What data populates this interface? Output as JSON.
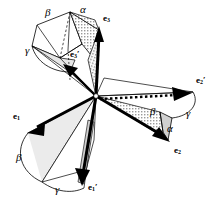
{
  "figure": {
    "type": "vector-diagram",
    "background": "#ffffff",
    "ink": "#000000",
    "fill_shade": "#b9b9b9",
    "width": 216,
    "height": 211,
    "origin": {
      "x": 96,
      "y": 96
    },
    "vectors": [
      {
        "name": "e1",
        "label": "e",
        "sub": "1",
        "prime": "",
        "label_x": 13,
        "label_y": 118,
        "tip_x": 28,
        "tip_y": 132,
        "style": "solid-bold"
      },
      {
        "name": "e2",
        "label": "e",
        "sub": "2",
        "prime": "",
        "label_x": 174,
        "label_y": 152,
        "tip_x": 170,
        "tip_y": 143,
        "style": "solid-bold"
      },
      {
        "name": "e3",
        "label": "e",
        "sub": "3",
        "prime": "",
        "label_x": 103,
        "label_y": 20,
        "tip_x": 99,
        "tip_y": 27,
        "style": "solid-bold"
      },
      {
        "name": "e1p",
        "label": "e",
        "sub": "1",
        "prime": "′",
        "label_x": 90,
        "label_y": 189,
        "tip_x": 84,
        "tip_y": 184,
        "style": "solid-bold"
      },
      {
        "name": "e2p",
        "label": "e",
        "sub": "2",
        "prime": "′",
        "label_x": 197,
        "label_y": 82,
        "tip_x": 193,
        "tip_y": 92,
        "style": "dotted-bold"
      },
      {
        "name": "e3p",
        "label": "e",
        "sub": "3",
        "prime": "′",
        "label_x": 72,
        "label_y": 56,
        "tip_x": 65,
        "tip_y": 66,
        "style": "solid-bold"
      }
    ],
    "angles": [
      {
        "name": "alpha-top",
        "glyph": "α",
        "x": 80,
        "y": 6
      },
      {
        "name": "beta-top",
        "glyph": "β",
        "x": 45,
        "y": 9
      },
      {
        "name": "gamma-top",
        "glyph": "γ",
        "x": 25,
        "y": 47
      },
      {
        "name": "beta-left",
        "glyph": "β",
        "x": 16,
        "y": 156
      },
      {
        "name": "gamma-bottom",
        "glyph": "γ",
        "x": 55,
        "y": 188
      },
      {
        "name": "beta-right",
        "glyph": "β",
        "x": 150,
        "y": 110
      },
      {
        "name": "gamma-right",
        "glyph": "γ",
        "x": 186,
        "y": 112
      },
      {
        "name": "alpha-right",
        "glyph": "α",
        "x": 167,
        "y": 127
      }
    ]
  }
}
